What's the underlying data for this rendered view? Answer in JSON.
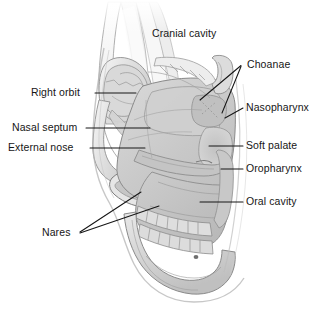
{
  "figure": {
    "background_color": "#ffffff",
    "ink_color": "#161616",
    "style": "grayscale medical illustration, pencil/airbrush shading"
  },
  "labels": [
    {
      "id": "cranial-cavity",
      "text": "Cranial cavity",
      "side": "top",
      "x": 152,
      "y": 28,
      "leader": false
    },
    {
      "id": "choanae",
      "text": "Choanae",
      "side": "right",
      "x": 247,
      "y": 59,
      "leader": true
    },
    {
      "id": "nasopharynx",
      "text": "Nasopharynx",
      "side": "right",
      "x": 246,
      "y": 102,
      "leader": true
    },
    {
      "id": "soft-palate",
      "text": "Soft palate",
      "side": "right",
      "x": 246,
      "y": 140,
      "leader": true
    },
    {
      "id": "oropharynx",
      "text": "Oropharynx",
      "side": "right",
      "x": 246,
      "y": 163,
      "leader": true
    },
    {
      "id": "oral-cavity",
      "text": "Oral cavity",
      "side": "right",
      "x": 246,
      "y": 196,
      "leader": true
    },
    {
      "id": "right-orbit",
      "text": "Right orbit",
      "side": "left",
      "x": 31,
      "y": 87,
      "leader": true
    },
    {
      "id": "nasal-septum",
      "text": "Nasal septum",
      "side": "left",
      "x": 12,
      "y": 122,
      "leader": true
    },
    {
      "id": "external-nose",
      "text": "External nose",
      "side": "left",
      "x": 8,
      "y": 142,
      "leader": true
    },
    {
      "id": "nares",
      "text": "Nares",
      "side": "left",
      "x": 42,
      "y": 227,
      "leader": true
    }
  ],
  "leader_lines": [
    {
      "for": "choanae",
      "points": "241,66 200,100"
    },
    {
      "for": "choanae",
      "points": "241,67 222,113"
    },
    {
      "for": "nasopharynx",
      "points": "243,108 225,118"
    },
    {
      "for": "soft-palate",
      "points": "243,146 209,146"
    },
    {
      "for": "oropharynx",
      "points": "243,169 221,169"
    },
    {
      "for": "oral-cavity",
      "points": "243,202 200,202"
    },
    {
      "for": "right-orbit",
      "points": "95,93 136,93"
    },
    {
      "for": "nasal-septum",
      "points": "86,128 150,128"
    },
    {
      "for": "external-nose",
      "points": "90,148 145,148"
    },
    {
      "for": "nares",
      "points": "80,232 141,192"
    },
    {
      "for": "nares",
      "points": "80,233 159,206"
    }
  ],
  "anatomy_regions": [
    "cranial cavity",
    "right orbit",
    "nasal septum",
    "external nose",
    "nares",
    "choanae",
    "nasopharynx",
    "soft palate",
    "oropharynx",
    "oral cavity",
    "maxillary teeth",
    "mandibular teeth",
    "mandible"
  ]
}
